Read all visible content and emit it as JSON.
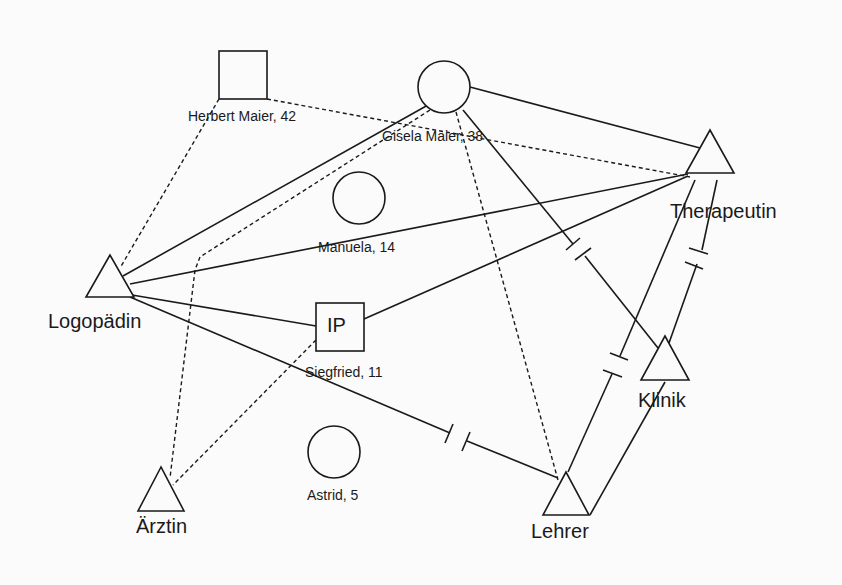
{
  "diagram": {
    "type": "ecomap",
    "nodes": [
      {
        "id": "herbert",
        "shape": "square",
        "label": "Herbert Maier, 42",
        "x": 243,
        "y": 75,
        "size": 48
      },
      {
        "id": "gisela",
        "shape": "circle",
        "label": "Gisela Maier, 38",
        "x": 444,
        "y": 87,
        "r": 26
      },
      {
        "id": "manuela",
        "shape": "circle",
        "label": "Manuela, 14",
        "x": 359,
        "y": 198,
        "r": 26
      },
      {
        "id": "siegfried",
        "shape": "square",
        "label": "Siegfried, 11",
        "inner": "IP",
        "x": 340,
        "y": 327,
        "size": 48
      },
      {
        "id": "astrid",
        "shape": "circle",
        "label": "Astrid, 5",
        "x": 334,
        "y": 452,
        "r": 26
      },
      {
        "id": "logopaedin",
        "shape": "triangle",
        "label": "Logopädin",
        "x": 110,
        "y": 279
      },
      {
        "id": "aerztin",
        "shape": "triangle",
        "label": "Ärztin",
        "x": 161,
        "y": 491
      },
      {
        "id": "therapeutin",
        "shape": "triangle",
        "label": "Therapeutin",
        "x": 710,
        "y": 155
      },
      {
        "id": "klinik",
        "shape": "triangle",
        "label": "Klinik",
        "x": 665,
        "y": 358
      },
      {
        "id": "lehrer",
        "shape": "triangle",
        "label": "Lehrer",
        "x": 566,
        "y": 495
      }
    ],
    "edges": [
      {
        "from": "herbert",
        "to": "therapeutin",
        "style": "dashed"
      },
      {
        "from": "herbert",
        "to": "logopaedin",
        "style": "dashed"
      },
      {
        "from": "gisela",
        "to": "therapeutin",
        "style": "solid"
      },
      {
        "from": "gisela",
        "to": "logopaedin",
        "style": "solid"
      },
      {
        "from": "gisela",
        "to": "aerztin",
        "style": "dashed"
      },
      {
        "from": "gisela",
        "to": "lehrer",
        "style": "dashed"
      },
      {
        "from": "gisela",
        "to": "klinik",
        "style": "conflict"
      },
      {
        "from": "logopaedin",
        "to": "therapeutin",
        "style": "solid"
      },
      {
        "from": "logopaedin",
        "to": "siegfried",
        "style": "solid"
      },
      {
        "from": "logopaedin",
        "to": "lehrer",
        "style": "conflict"
      },
      {
        "from": "siegfried",
        "to": "therapeutin",
        "style": "solid"
      },
      {
        "from": "siegfried",
        "to": "aerztin",
        "style": "dashed"
      },
      {
        "from": "therapeutin",
        "to": "lehrer",
        "style": "conflict"
      },
      {
        "from": "therapeutin",
        "to": "klinik",
        "style": "conflict"
      },
      {
        "from": "klinik",
        "to": "lehrer",
        "style": "solid"
      }
    ]
  },
  "labels": {
    "herbert": "Herbert Maier, 42",
    "gisela": "Gisela Maier, 38",
    "manuela": "Manuela, 14",
    "siegfried": "Siegfried, 11",
    "siegfried_inner": "IP",
    "astrid": "Astrid, 5",
    "logopaedin": "Logopädin",
    "aerztin": "Ärztin",
    "therapeutin": "Therapeutin",
    "klinik": "Klinik",
    "lehrer": "Lehrer"
  }
}
